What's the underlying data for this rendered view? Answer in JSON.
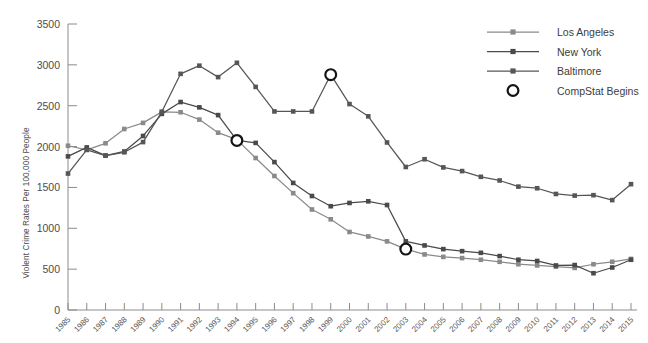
{
  "chart_data": {
    "type": "line",
    "title": "",
    "xlabel": "",
    "ylabel": "Violent Crime Rates Per 100,000 People",
    "ylim": [
      0,
      3500
    ],
    "ytick_step": 500,
    "yticks": [
      "0",
      "500",
      "1000",
      "1500",
      "2000",
      "2500",
      "3000",
      "3500"
    ],
    "grid": false,
    "legend_position": "top-right",
    "x": [
      1985,
      1986,
      1987,
      1988,
      1989,
      1990,
      1991,
      1992,
      1993,
      1994,
      1995,
      1996,
      1997,
      1998,
      1999,
      2000,
      2001,
      2002,
      2003,
      2004,
      2005,
      2006,
      2007,
      2008,
      2009,
      2010,
      2011,
      2012,
      2013,
      2014,
      2015
    ],
    "categories": [
      "1985",
      "1986",
      "1987",
      "1988",
      "1989",
      "1990",
      "1991",
      "1992",
      "1993",
      "1994",
      "1995",
      "1996",
      "1997",
      "1998",
      "1999",
      "2000",
      "2001",
      "2002",
      "2003",
      "2004",
      "2005",
      "2006",
      "2007",
      "2008",
      "2009",
      "2010",
      "2011",
      "2012",
      "2013",
      "2014",
      "2015"
    ],
    "series": [
      {
        "name": "Los Angeles",
        "color": "#8a8a8a",
        "values": [
          2010,
          1960,
          2040,
          2215,
          2290,
          2425,
          2420,
          2330,
          2170,
          2085,
          1860,
          1640,
          1430,
          1230,
          1110,
          955,
          900,
          840,
          745,
          680,
          650,
          635,
          615,
          590,
          560,
          545,
          530,
          515,
          560,
          590,
          625
        ]
      },
      {
        "name": "New York",
        "color": "#4a4a4a",
        "values": [
          1880,
          1990,
          1890,
          1940,
          2130,
          2400,
          2545,
          2480,
          2385,
          2075,
          2045,
          1810,
          1555,
          1395,
          1270,
          1310,
          1330,
          1285,
          840,
          790,
          745,
          720,
          700,
          660,
          615,
          600,
          545,
          550,
          450,
          520,
          615
        ]
      },
      {
        "name": "Baltimore",
        "color": "#565656",
        "values": [
          1670,
          1960,
          1890,
          1930,
          2055,
          2425,
          2890,
          2990,
          2850,
          3025,
          2730,
          2430,
          2430,
          2430,
          2880,
          2520,
          2370,
          2050,
          1750,
          1845,
          1745,
          1700,
          1630,
          1585,
          1510,
          1490,
          1420,
          1400,
          1405,
          1345,
          1540
        ]
      }
    ],
    "annotations": {
      "label": "CompStat Begins",
      "marker": "open-circle",
      "points": [
        {
          "series": "New York",
          "year": 1994,
          "value": 2075
        },
        {
          "series": "Baltimore",
          "year": 1999,
          "value": 2880
        },
        {
          "series": "Los Angeles",
          "year": 2003,
          "value": 745
        }
      ]
    },
    "legend": [
      {
        "label": "Los Angeles",
        "color": "#8a8a8a",
        "marker": "square-line"
      },
      {
        "label": "New York",
        "color": "#4a4a4a",
        "marker": "square-line"
      },
      {
        "label": "Baltimore",
        "color": "#565656",
        "marker": "square-line"
      },
      {
        "label": "CompStat Begins",
        "color": "#1a1a1a",
        "marker": "open-circle"
      }
    ]
  },
  "axes": {
    "y_axis_label": "Violent Crime Rates Per 100,000 People",
    "axis_color": "#8c8c8c"
  }
}
